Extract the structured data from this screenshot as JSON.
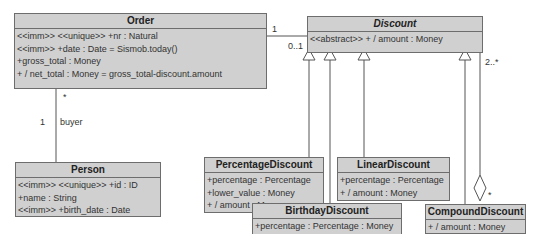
{
  "classes": {
    "order": {
      "name": "Order",
      "attributes": [
        "<<imm>> <<unique>> +nr : Natural",
        "<<imm>> +date : Date = Sismob.today()",
        "+gross_total : Money",
        "+ / net_total : Money = gross_total-discount.amount"
      ]
    },
    "discount": {
      "name": "Discount",
      "abstract": true,
      "attributes": [
        "<<abstract>> + / amount : Money"
      ]
    },
    "person": {
      "name": "Person",
      "attributes": [
        "<<imm>> <<unique>> +id : ID",
        "+name : String",
        "<<imm>> +birth_date : Date"
      ]
    },
    "percentage_discount": {
      "name": "PercentageDiscount",
      "attributes": [
        "+percentage : Percentage",
        "+lower_value : Money",
        "+ / amount : Money"
      ]
    },
    "linear_discount": {
      "name": "LinearDiscount",
      "attributes": [
        "+percentage : Percentage",
        "+ / amount : Money"
      ]
    },
    "birthday_discount": {
      "name": "BirthdayDiscount",
      "attributes": [
        "+percentage : Percentage : Money",
        "+ / amount : Money"
      ]
    },
    "compound_discount": {
      "name": "CompoundDiscount",
      "attributes": [
        "+ / amount : Money"
      ]
    }
  },
  "associations": {
    "order_discount": {
      "order_end": "1",
      "discount_end": "0..1"
    },
    "order_person": {
      "order_end": "*",
      "person_end": "1",
      "role": "buyer"
    },
    "compound_aggregation": {
      "discount_end": "2..*",
      "compound_end": "*"
    }
  },
  "colors": {
    "class_fill": "#d0d0d0",
    "border": "#6d6d6d",
    "line": "#555555"
  }
}
